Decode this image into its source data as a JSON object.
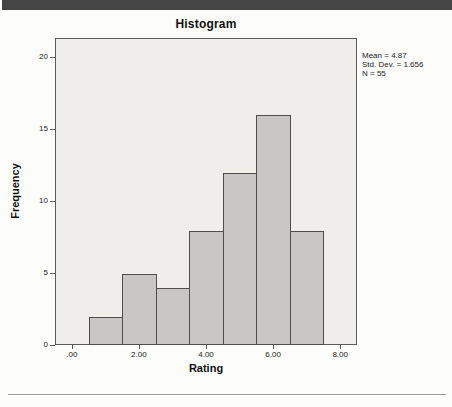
{
  "window": {
    "top_bar_color": "#454545",
    "divider_color": "#9E9E9E"
  },
  "chart_data": {
    "type": "bar",
    "chart_kind": "histogram",
    "title": "Histogram",
    "xlabel": "Rating",
    "ylabel": "Frequency",
    "bin_centers": [
      1,
      2,
      3,
      4,
      5,
      6,
      7
    ],
    "bin_width": 1,
    "values": [
      2,
      5,
      4,
      8,
      12,
      16,
      8
    ],
    "xlim": [
      -0.5,
      8.5
    ],
    "ylim": [
      0,
      21.3
    ],
    "x_ticks": [
      {
        "value": 0,
        "label": ".00"
      },
      {
        "value": 2,
        "label": "2.00"
      },
      {
        "value": 4,
        "label": "4.00"
      },
      {
        "value": 6,
        "label": "6.00"
      },
      {
        "value": 8,
        "label": "8.00"
      }
    ],
    "y_ticks": [
      {
        "value": 0,
        "label": "0"
      },
      {
        "value": 5,
        "label": "5"
      },
      {
        "value": 10,
        "label": "10"
      },
      {
        "value": 15,
        "label": "15"
      },
      {
        "value": 20,
        "label": "20"
      }
    ],
    "grid": false,
    "legend_position": "none",
    "annotation": {
      "lines": [
        "Mean = 4.87",
        "Std. Dev. = 1.656",
        "N = 55"
      ]
    },
    "colors": {
      "bar_fill": "#C8C7C5",
      "bar_border": "#4E4E4E",
      "plot_background": "#EFEEEB",
      "axis": "#5A5A5A"
    }
  }
}
